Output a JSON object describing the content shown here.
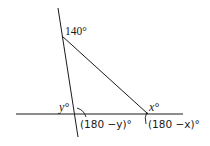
{
  "diagram": {
    "stroke_color": "#1a1a1a",
    "lines": {
      "horizontal": {
        "x1": 16,
        "y1": 114,
        "x2": 183,
        "y2": 114
      },
      "steep": {
        "x1": 58,
        "y1": 8,
        "x2": 78,
        "y2": 137
      },
      "diagonal": {
        "x1": 62,
        "y1": 36,
        "x2": 148,
        "y2": 114
      }
    },
    "labels": {
      "top_angle": "140°",
      "left_interior_angle": "y°",
      "left_exterior_angle": "(180 −y)°",
      "right_interior_angle": "x°",
      "right_exterior_angle": "(180 −x)°"
    }
  }
}
